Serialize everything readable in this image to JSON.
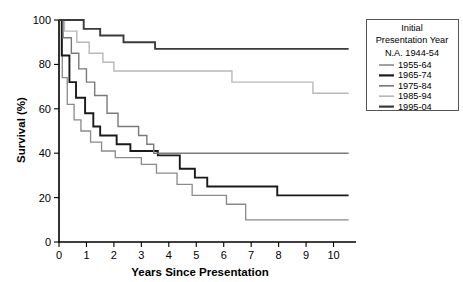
{
  "chart_data": {
    "type": "line",
    "title": "",
    "xlabel": "Years Since Presentation",
    "ylabel": "Survival (%)",
    "xlim": [
      0,
      10.6
    ],
    "ylim": [
      0,
      100
    ],
    "xticks": [
      "0",
      "1",
      "2",
      "3",
      "4",
      "5",
      "6",
      "7",
      "8",
      "9",
      "10"
    ],
    "yticks": [
      "0",
      "20",
      "40",
      "60",
      "80",
      "100"
    ],
    "grid": false,
    "legend_position": "right",
    "legend_title_line1": "Initial",
    "legend_title_line2": "Presentation Year",
    "legend_note": "N.A. 1944-54",
    "series": [
      {
        "name": "1955-64",
        "color": "#8a8a8a",
        "width": 1.3,
        "points": [
          [
            0,
            100
          ],
          [
            0.12,
            100
          ],
          [
            0.12,
            74
          ],
          [
            0.3,
            74
          ],
          [
            0.3,
            62
          ],
          [
            0.55,
            62
          ],
          [
            0.55,
            55
          ],
          [
            0.8,
            55
          ],
          [
            0.8,
            50
          ],
          [
            1.15,
            50
          ],
          [
            1.15,
            45
          ],
          [
            1.55,
            45
          ],
          [
            1.55,
            41
          ],
          [
            2.05,
            41
          ],
          [
            2.05,
            38
          ],
          [
            3.0,
            38
          ],
          [
            3.0,
            35
          ],
          [
            3.55,
            35
          ],
          [
            3.55,
            31
          ],
          [
            4.3,
            31
          ],
          [
            4.3,
            26
          ],
          [
            4.85,
            26
          ],
          [
            4.85,
            21
          ],
          [
            6.1,
            21
          ],
          [
            6.1,
            17
          ],
          [
            6.8,
            17
          ],
          [
            6.8,
            10
          ],
          [
            10.55,
            10
          ]
        ]
      },
      {
        "name": "1965-74",
        "color": "#1a1a1a",
        "width": 1.9,
        "points": [
          [
            0,
            100
          ],
          [
            0.1,
            100
          ],
          [
            0.1,
            84
          ],
          [
            0.38,
            84
          ],
          [
            0.38,
            72
          ],
          [
            0.62,
            72
          ],
          [
            0.62,
            65
          ],
          [
            0.95,
            65
          ],
          [
            0.95,
            58
          ],
          [
            1.25,
            58
          ],
          [
            1.25,
            52
          ],
          [
            1.5,
            52
          ],
          [
            1.5,
            48
          ],
          [
            2.1,
            48
          ],
          [
            2.1,
            44
          ],
          [
            2.6,
            44
          ],
          [
            2.6,
            41
          ],
          [
            3.6,
            41
          ],
          [
            3.6,
            39
          ],
          [
            4.4,
            39
          ],
          [
            4.4,
            33
          ],
          [
            4.95,
            33
          ],
          [
            4.95,
            29
          ],
          [
            5.4,
            29
          ],
          [
            5.4,
            25
          ],
          [
            7.95,
            25
          ],
          [
            7.95,
            21
          ],
          [
            10.55,
            21
          ]
        ]
      },
      {
        "name": "1975-84",
        "color": "#7a7a7a",
        "width": 1.4,
        "points": [
          [
            0,
            100
          ],
          [
            0.15,
            100
          ],
          [
            0.15,
            92
          ],
          [
            0.45,
            92
          ],
          [
            0.45,
            85
          ],
          [
            0.72,
            85
          ],
          [
            0.72,
            78
          ],
          [
            1.0,
            78
          ],
          [
            1.0,
            72
          ],
          [
            1.3,
            72
          ],
          [
            1.3,
            66
          ],
          [
            1.75,
            66
          ],
          [
            1.75,
            58
          ],
          [
            2.15,
            58
          ],
          [
            2.15,
            52
          ],
          [
            2.9,
            52
          ],
          [
            2.9,
            48
          ],
          [
            3.2,
            48
          ],
          [
            3.2,
            44
          ],
          [
            3.45,
            44
          ],
          [
            3.45,
            40
          ],
          [
            10.55,
            40
          ]
        ]
      },
      {
        "name": "1985-94",
        "color": "#b8b8b8",
        "width": 1.4,
        "points": [
          [
            0,
            100
          ],
          [
            0.2,
            100
          ],
          [
            0.2,
            95
          ],
          [
            0.65,
            95
          ],
          [
            0.65,
            90
          ],
          [
            1.1,
            90
          ],
          [
            1.1,
            85
          ],
          [
            1.6,
            85
          ],
          [
            1.6,
            81
          ],
          [
            2.0,
            81
          ],
          [
            2.0,
            77
          ],
          [
            6.3,
            77
          ],
          [
            6.3,
            72
          ],
          [
            9.25,
            72
          ],
          [
            9.25,
            67
          ],
          [
            10.55,
            67
          ]
        ]
      },
      {
        "name": "1995-04",
        "color": "#3a3a3a",
        "width": 1.9,
        "points": [
          [
            0,
            100
          ],
          [
            0.9,
            100
          ],
          [
            0.9,
            96
          ],
          [
            1.5,
            96
          ],
          [
            1.5,
            93
          ],
          [
            2.35,
            93
          ],
          [
            2.35,
            90
          ],
          [
            3.5,
            90
          ],
          [
            3.5,
            87
          ],
          [
            10.55,
            87
          ]
        ]
      }
    ]
  },
  "axes": {
    "y_title": "Survival (%)",
    "x_title": "Years Since Presentation"
  },
  "legend": {
    "title_line1": "Initial",
    "title_line2": "Presentation Year",
    "na_entry": "N.A. 1944-54",
    "entries": [
      {
        "label": "1955-64"
      },
      {
        "label": "1965-74"
      },
      {
        "label": "1975-84"
      },
      {
        "label": "1985-94"
      },
      {
        "label": "1995-04"
      }
    ]
  }
}
